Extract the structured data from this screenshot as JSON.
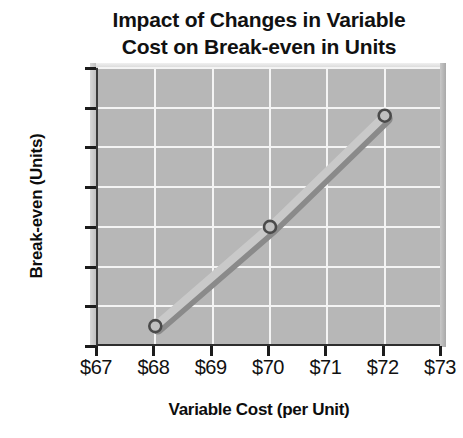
{
  "chart_data": {
    "type": "line",
    "title": "Impact of Changes in Variable Cost on Break-even in Units",
    "title_lines": [
      "Impact of Changes in Variable",
      "Cost on Break-even in Units"
    ],
    "xlabel": "Variable Cost (per Unit)",
    "ylabel": "Break-even (Units)",
    "x": [
      68,
      70,
      72
    ],
    "values": [
      750,
      800,
      856
    ],
    "points": [
      {
        "x": 68,
        "x_label": "$68",
        "y": 750
      },
      {
        "x": 70,
        "x_label": "$70",
        "y": 800
      },
      {
        "x": 72,
        "x_label": "$72",
        "y": 856
      }
    ],
    "xlim": [
      67,
      73
    ],
    "ylim": [
      740,
      880
    ],
    "x_ticks": [
      67,
      68,
      69,
      70,
      71,
      72,
      73
    ],
    "x_tick_labels": [
      "$67",
      "$68",
      "$69",
      "$70",
      "$71",
      "$72",
      "$73"
    ],
    "y_ticks": [
      740,
      760,
      780,
      800,
      820,
      840,
      860,
      880
    ],
    "y_tick_labels": [
      "740",
      "760",
      "780",
      "800",
      "820",
      "840",
      "860",
      "880"
    ],
    "grid": true,
    "legend": false,
    "colors": {
      "plot_background": "#b7b7b7",
      "gridline": "#f4f4f4",
      "series_line": "#c9c9c9",
      "series_shadow": "#8a8a8a",
      "marker_edge": "#4a4a4a",
      "marker_fill": "#c0c0c0",
      "axis": "#1c1c1c",
      "text": "#111111",
      "page_background": "#ffffff"
    }
  }
}
